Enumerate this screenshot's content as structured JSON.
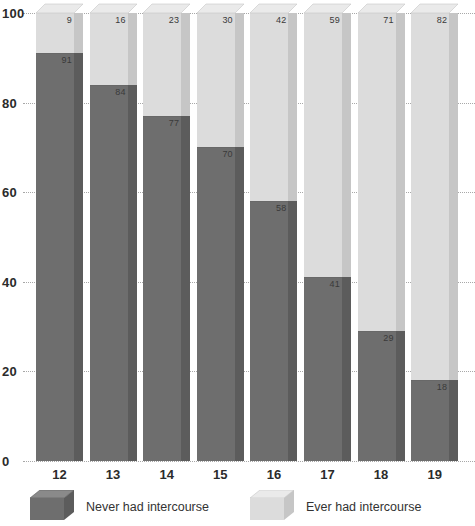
{
  "chart_data": {
    "type": "bar",
    "subtype": "stacked-100-percent-3d",
    "title": "",
    "xlabel": "",
    "ylabel": "",
    "categories": [
      "12",
      "13",
      "14",
      "15",
      "16",
      "17",
      "18",
      "19"
    ],
    "ylim": [
      0,
      100
    ],
    "yticks": [
      "0",
      "20",
      "40",
      "60",
      "80",
      "100"
    ],
    "ytick_values": [
      0,
      20,
      40,
      60,
      80,
      100
    ],
    "grid": true,
    "legend_position": "bottom",
    "series": [
      {
        "name": "Never had intercourse",
        "color": "#6e6e6e",
        "values": [
          91,
          84,
          77,
          70,
          58,
          41,
          29,
          18
        ]
      },
      {
        "name": "Ever had intercourse",
        "color": "#dcdcdc",
        "values": [
          9,
          16,
          23,
          30,
          42,
          59,
          71,
          82
        ]
      }
    ]
  },
  "legend": {
    "items": [
      {
        "label": "Never had intercourse",
        "swatch": "dark-cube-icon"
      },
      {
        "label": "Ever had intercourse",
        "swatch": "light-cube-icon"
      }
    ]
  },
  "colors": {
    "dark_front": "#6e6e6e",
    "dark_side": "#5c5c5c",
    "dark_top": "#8a8a8a",
    "light_front": "#dcdcdc",
    "light_side": "#c6c6c6",
    "light_top": "#eaeaea",
    "gridline": "#a8a8a8",
    "text": "#2b2b2b",
    "label_text": "#3a3a3a",
    "background": "#ffffff"
  }
}
